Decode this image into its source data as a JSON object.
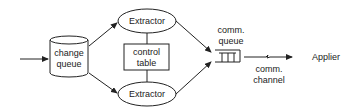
{
  "diagram": {
    "nodes": {
      "change_queue": {
        "line1": "change",
        "line2": "queue"
      },
      "extractor_top": {
        "label": "Extractor"
      },
      "extractor_bottom": {
        "label": "Extractor"
      },
      "control_table": {
        "line1": "control",
        "line2": "table"
      },
      "comm_queue": {
        "line1": "comm.",
        "line2": "queue"
      },
      "comm_channel": {
        "line1": "comm.",
        "line2": "channel"
      },
      "applier": {
        "label": "Applier"
      }
    },
    "colors": {
      "stroke": "#222222",
      "background": "#ffffff"
    }
  }
}
